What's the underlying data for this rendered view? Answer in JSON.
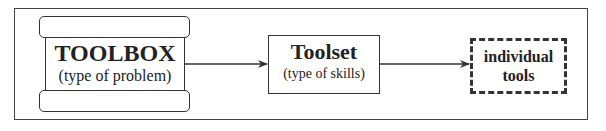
{
  "diagram": {
    "type": "flow",
    "nodes": [
      {
        "id": "toolbox",
        "title": "TOOLBOX",
        "subtitle": "(type of problem)",
        "shape": "toolbox"
      },
      {
        "id": "toolset",
        "title": "Toolset",
        "subtitle": "(type of skills)",
        "shape": "rectangle"
      },
      {
        "id": "tools",
        "label_line1": "individual",
        "label_line2": "tools",
        "shape": "dashed-rectangle"
      }
    ],
    "edges": [
      {
        "from": "toolbox",
        "to": "toolset"
      },
      {
        "from": "toolset",
        "to": "tools"
      }
    ]
  },
  "colors": {
    "stroke": "#333333",
    "background": "#ffffff"
  }
}
